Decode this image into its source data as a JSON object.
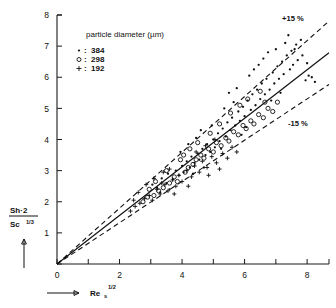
{
  "chart_data": {
    "type": "scatter",
    "title": "",
    "xlabel": "Re_s^1/2",
    "ylabel": "Sh·2 / Sc^1/3",
    "xlim": [
      0,
      8.7
    ],
    "ylim": [
      0,
      8
    ],
    "grid": false,
    "legend_position": "upper-left",
    "legend_title": "particle diameter (µm)",
    "xticks": [
      0,
      1,
      2,
      3,
      4,
      5,
      6,
      7,
      8
    ],
    "xticklabels": [
      "0",
      "",
      "2",
      "",
      "4",
      "",
      "6",
      "",
      "8"
    ],
    "yticks": [
      0,
      1,
      2,
      3,
      4,
      5,
      6,
      7,
      8
    ],
    "yticklabels": [
      "",
      "1",
      "2",
      "3",
      "4",
      "5",
      "6",
      "7",
      "8"
    ],
    "annotations": [
      {
        "text": "+15 %",
        "x": 7.9,
        "y": 7.75
      },
      {
        "text": "-15 %",
        "x": 7.85,
        "y": 4.45
      }
    ],
    "reference_lines": [
      {
        "name": "parity-fit",
        "style": "solid",
        "slope": 0.78,
        "intercept": 0.0
      },
      {
        "name": "plus-15-percent",
        "style": "dashed",
        "slope": 0.897,
        "intercept": 0.0
      },
      {
        "name": "minus-15-percent",
        "style": "dashed",
        "slope": 0.663,
        "intercept": 0.0
      }
    ],
    "series": [
      {
        "name": "384",
        "label": "384",
        "marker": "dot",
        "marker_symbol": "•",
        "points": [
          [
            3.05,
            2.55
          ],
          [
            3.2,
            2.45
          ],
          [
            3.35,
            2.75
          ],
          [
            3.5,
            2.6
          ],
          [
            3.55,
            2.9
          ],
          [
            3.7,
            2.72
          ],
          [
            3.8,
            3.0
          ],
          [
            3.9,
            2.85
          ],
          [
            4.0,
            3.15
          ],
          [
            4.05,
            2.95
          ],
          [
            4.15,
            3.3
          ],
          [
            4.25,
            3.1
          ],
          [
            4.3,
            3.45
          ],
          [
            4.4,
            3.25
          ],
          [
            4.5,
            3.55
          ],
          [
            4.55,
            3.35
          ],
          [
            4.65,
            3.7
          ],
          [
            4.75,
            3.5
          ],
          [
            4.8,
            3.85
          ],
          [
            4.9,
            3.6
          ],
          [
            5.0,
            4.0
          ],
          [
            5.05,
            3.75
          ],
          [
            5.15,
            4.2
          ],
          [
            5.2,
            3.95
          ],
          [
            5.3,
            4.35
          ],
          [
            5.4,
            4.1
          ],
          [
            5.45,
            4.55
          ],
          [
            5.55,
            4.3
          ],
          [
            5.6,
            4.7
          ],
          [
            5.7,
            4.45
          ],
          [
            5.8,
            4.9
          ],
          [
            5.85,
            4.6
          ],
          [
            5.95,
            5.05
          ],
          [
            6.0,
            4.75
          ],
          [
            6.1,
            5.25
          ],
          [
            6.2,
            4.95
          ],
          [
            6.25,
            5.45
          ],
          [
            6.35,
            5.1
          ],
          [
            6.4,
            5.6
          ],
          [
            6.5,
            5.3
          ],
          [
            6.55,
            5.8
          ],
          [
            6.65,
            5.45
          ],
          [
            6.7,
            5.95
          ],
          [
            6.8,
            5.6
          ],
          [
            6.9,
            6.15
          ],
          [
            6.95,
            5.8
          ],
          [
            7.05,
            6.35
          ],
          [
            7.1,
            5.95
          ],
          [
            7.2,
            6.5
          ],
          [
            7.25,
            6.1
          ],
          [
            7.35,
            6.7
          ],
          [
            7.45,
            6.25
          ],
          [
            7.5,
            6.85
          ],
          [
            7.55,
            6.4
          ],
          [
            7.65,
            7.05
          ],
          [
            7.7,
            6.55
          ],
          [
            7.8,
            7.2
          ],
          [
            7.85,
            6.7
          ],
          [
            7.95,
            5.9
          ],
          [
            8.05,
            6.05
          ],
          [
            8.15,
            6.0
          ],
          [
            8.25,
            5.85
          ],
          [
            6.3,
            6.25
          ],
          [
            6.45,
            6.4
          ],
          [
            6.6,
            6.6
          ],
          [
            5.5,
            5.5
          ],
          [
            5.75,
            5.65
          ],
          [
            4.95,
            4.45
          ],
          [
            4.45,
            4.05
          ],
          [
            4.2,
            3.85
          ],
          [
            3.95,
            3.6
          ],
          [
            5.35,
            5.0
          ],
          [
            6.15,
            6.05
          ],
          [
            7.0,
            6.9
          ],
          [
            7.3,
            7.1
          ],
          [
            7.6,
            6.9
          ],
          [
            8.0,
            6.45
          ],
          [
            6.85,
            5.25
          ],
          [
            7.15,
            5.5
          ],
          [
            6.05,
            4.4
          ],
          [
            5.9,
            4.15
          ],
          [
            5.25,
            3.7
          ],
          [
            4.7,
            3.1
          ],
          [
            4.35,
            2.9
          ],
          [
            3.6,
            2.4
          ],
          [
            3.3,
            2.3
          ],
          [
            6.75,
            6.8
          ],
          [
            7.4,
            7.35
          ],
          [
            5.65,
            5.2
          ],
          [
            4.6,
            4.3
          ]
        ]
      },
      {
        "name": "298",
        "label": "298",
        "marker": "circle",
        "marker_symbol": "○",
        "points": [
          [
            2.75,
            2.0
          ],
          [
            2.9,
            2.15
          ],
          [
            3.1,
            2.2
          ],
          [
            3.25,
            2.35
          ],
          [
            3.4,
            2.45
          ],
          [
            3.6,
            2.6
          ],
          [
            3.75,
            2.8
          ],
          [
            3.85,
            2.65
          ],
          [
            4.1,
            2.95
          ],
          [
            4.2,
            3.1
          ],
          [
            4.35,
            3.2
          ],
          [
            4.45,
            3.35
          ],
          [
            4.6,
            3.5
          ],
          [
            4.7,
            3.4
          ],
          [
            4.85,
            3.7
          ],
          [
            5.0,
            3.6
          ],
          [
            5.1,
            3.9
          ],
          [
            5.25,
            3.8
          ],
          [
            5.4,
            4.05
          ],
          [
            5.5,
            3.95
          ],
          [
            5.65,
            4.25
          ],
          [
            5.8,
            4.15
          ],
          [
            5.95,
            4.45
          ],
          [
            6.05,
            4.35
          ],
          [
            6.2,
            4.6
          ],
          [
            6.3,
            4.5
          ],
          [
            6.45,
            4.8
          ],
          [
            6.6,
            4.7
          ],
          [
            6.75,
            5.0
          ],
          [
            6.9,
            4.9
          ],
          [
            7.05,
            5.2
          ],
          [
            5.2,
            4.5
          ],
          [
            5.55,
            4.85
          ],
          [
            4.5,
            3.9
          ],
          [
            4.05,
            3.5
          ],
          [
            3.95,
            3.35
          ],
          [
            3.5,
            3.0
          ],
          [
            3.15,
            2.65
          ],
          [
            6.1,
            5.3
          ],
          [
            6.5,
            5.55
          ],
          [
            5.85,
            5.1
          ],
          [
            4.9,
            4.2
          ],
          [
            4.25,
            3.7
          ],
          [
            2.95,
            2.4
          ],
          [
            6.65,
            5.2
          ]
        ]
      },
      {
        "name": "192",
        "label": "192",
        "marker": "plus",
        "marker_symbol": "+",
        "points": [
          [
            2.35,
            1.7
          ],
          [
            2.5,
            1.85
          ],
          [
            2.65,
            1.95
          ],
          [
            2.8,
            2.1
          ],
          [
            2.95,
            2.2
          ],
          [
            3.05,
            2.05
          ],
          [
            3.2,
            2.4
          ],
          [
            3.3,
            2.25
          ],
          [
            3.45,
            2.55
          ],
          [
            3.55,
            2.35
          ],
          [
            3.7,
            2.7
          ],
          [
            3.8,
            2.5
          ],
          [
            3.9,
            2.85
          ],
          [
            4.0,
            2.65
          ],
          [
            4.15,
            3.0
          ],
          [
            4.3,
            2.8
          ],
          [
            4.4,
            3.15
          ],
          [
            4.55,
            2.95
          ],
          [
            4.65,
            3.3
          ],
          [
            4.8,
            3.1
          ],
          [
            4.95,
            3.45
          ],
          [
            5.1,
            3.25
          ],
          [
            5.3,
            3.55
          ],
          [
            5.45,
            3.4
          ],
          [
            5.6,
            3.75
          ],
          [
            5.75,
            3.6
          ],
          [
            3.4,
            2.95
          ],
          [
            3.1,
            2.75
          ],
          [
            2.85,
            2.55
          ],
          [
            2.6,
            2.3
          ],
          [
            4.45,
            3.6
          ],
          [
            4.75,
            3.8
          ],
          [
            5.05,
            4.0
          ],
          [
            3.35,
            2.6
          ],
          [
            2.45,
            2.05
          ],
          [
            5.2,
            3.05
          ],
          [
            4.85,
            2.85
          ],
          [
            4.2,
            2.5
          ],
          [
            3.75,
            2.25
          ],
          [
            3.6,
            3.05
          ]
        ]
      }
    ]
  },
  "legend": {
    "title": "particle diameter (µm)",
    "entries": [
      {
        "symbol": "•",
        "separator": ":",
        "value": "384"
      },
      {
        "symbol": "○",
        "separator": ":",
        "value": "298"
      },
      {
        "symbol": "+",
        "separator": ":",
        "value": "192"
      }
    ]
  },
  "axes": {
    "y": {
      "title_numerator": "Sh·2",
      "title_denominator": "Sc",
      "title_denominator_sup": "1/3",
      "labels": [
        "1",
        "2",
        "3",
        "4",
        "5",
        "6",
        "7",
        "8"
      ]
    },
    "x": {
      "title_base": "Re",
      "title_sub": "s",
      "title_sup": "1/2",
      "labels": [
        "0",
        "2",
        "4",
        "6",
        "8"
      ]
    }
  },
  "annotations": {
    "upper_band": "+15 %",
    "lower_band": "-15 %"
  },
  "colors": {
    "ink": "#111111",
    "background": "#ffffff"
  }
}
